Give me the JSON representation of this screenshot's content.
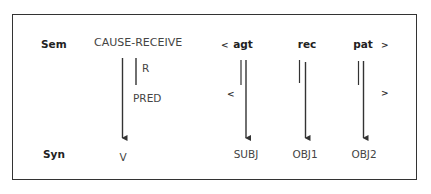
{
  "diagram": {
    "rows": {
      "sem_label": "Sem",
      "syn_label": "Syn"
    },
    "predicate": {
      "label": "CAUSE-RECEIVE",
      "relation_label": "R",
      "pred_label": "PRED",
      "syn_label": "V"
    },
    "argument_structure": {
      "open_bracket": "<",
      "close_bracket": ">",
      "arguments": [
        {
          "role": "agt",
          "function": "SUBJ"
        },
        {
          "role": "rec",
          "function": "OBJ1"
        },
        {
          "role": "pat",
          "function": "OBJ2"
        }
      ],
      "inner_open_bracket": "<",
      "inner_close_bracket": ">"
    },
    "colors": {
      "line": "#333333",
      "text": "#444444"
    }
  }
}
